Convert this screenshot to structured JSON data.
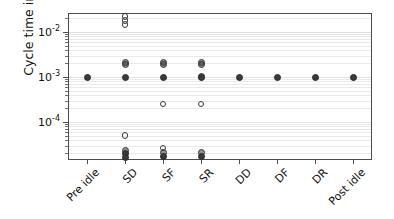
{
  "chart_data": {
    "type": "scatter",
    "title": "",
    "xlabel": "",
    "ylabel": "Cycle time in s",
    "yscale": "log",
    "ylim": [
      1.1e-05,
      0.032
    ],
    "grid": "horizontal-minor-and-major",
    "legend": "none",
    "categories": [
      "Pre idle",
      "SD",
      "SF",
      "SR",
      "DD",
      "DF",
      "DR",
      "Post idle"
    ],
    "ytick_labels": [
      "10⁻²",
      "10⁻³",
      "10⁻⁴"
    ],
    "ytick_values": [
      0.01,
      0.001,
      0.0001
    ],
    "ytick_mantissas": [
      "10",
      "10",
      "10"
    ],
    "ytick_exponents": [
      "-2",
      "-3",
      "-4"
    ],
    "series": [
      {
        "name": "Pre idle",
        "category": "Pre idle",
        "points": [
          {
            "y": 0.001,
            "style": "solid",
            "count": 1
          }
        ]
      },
      {
        "name": "SD",
        "category": "SD",
        "points": [
          {
            "y": 0.022,
            "style": "open",
            "count": 1
          },
          {
            "y": 0.018,
            "style": "open",
            "count": 1
          },
          {
            "y": 0.0145,
            "style": "open",
            "count": 1
          },
          {
            "y": 0.00215,
            "style": "semi",
            "count": 1
          },
          {
            "y": 0.0019,
            "style": "semi",
            "count": 1
          },
          {
            "y": 0.001,
            "style": "solid",
            "count": 1
          },
          {
            "y": 5e-05,
            "style": "open",
            "count": 1
          },
          {
            "y": 2.35e-05,
            "style": "semi",
            "count": 1
          },
          {
            "y": 1.95e-05,
            "style": "solid",
            "count": 1
          },
          {
            "y": 1.65e-05,
            "style": "solid",
            "count": 1
          }
        ]
      },
      {
        "name": "SF",
        "category": "SF",
        "points": [
          {
            "y": 0.00215,
            "style": "semi",
            "count": 1
          },
          {
            "y": 0.0019,
            "style": "semi",
            "count": 1
          },
          {
            "y": 0.001,
            "style": "solid",
            "count": 1
          },
          {
            "y": 0.00025,
            "style": "open",
            "count": 1
          },
          {
            "y": 2.65e-05,
            "style": "open",
            "count": 1
          },
          {
            "y": 2.15e-05,
            "style": "semi",
            "count": 1
          },
          {
            "y": 1.75e-05,
            "style": "solid",
            "count": 1
          }
        ]
      },
      {
        "name": "SR",
        "category": "SR",
        "points": [
          {
            "y": 0.00215,
            "style": "semi",
            "count": 1
          },
          {
            "y": 0.0019,
            "style": "semi",
            "count": 1
          },
          {
            "y": 0.00105,
            "style": "semi",
            "count": 1
          },
          {
            "y": 0.001,
            "style": "solid",
            "count": 1
          },
          {
            "y": 0.00025,
            "style": "open",
            "count": 1
          },
          {
            "y": 2.15e-05,
            "style": "semi",
            "count": 1
          },
          {
            "y": 1.75e-05,
            "style": "solid",
            "count": 1
          }
        ]
      },
      {
        "name": "DD",
        "category": "DD",
        "points": [
          {
            "y": 0.001,
            "style": "solid",
            "count": 1
          }
        ]
      },
      {
        "name": "DF",
        "category": "DF",
        "points": [
          {
            "y": 0.001,
            "style": "solid",
            "count": 1
          }
        ]
      },
      {
        "name": "DR",
        "category": "DR",
        "points": [
          {
            "y": 0.001,
            "style": "solid",
            "count": 1
          }
        ]
      },
      {
        "name": "Post idle",
        "category": "Post idle",
        "points": [
          {
            "y": 0.001,
            "style": "solid",
            "count": 1
          }
        ]
      }
    ]
  },
  "axes": {
    "ylabel": "Cycle time in s"
  },
  "colors": {
    "marker": "#3a3a3a",
    "frame": "#4d4d4d",
    "grid": "#e9e9e9",
    "text": "#111111",
    "background": "#ffffff"
  }
}
